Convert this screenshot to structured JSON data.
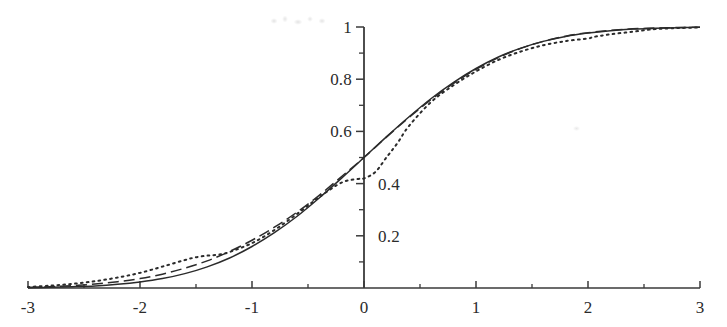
{
  "figure": {
    "background_color": "#ffffff",
    "ink_color": "#2b2b2b",
    "axis_color": "#3a3a3a",
    "artifacts": {
      "top_smudge_note": "faint illegible scan smudge",
      "right_speck_note": "faint scan speck"
    }
  },
  "chart_data": {
    "type": "line",
    "title": "",
    "subtitle": "",
    "xlabel": "",
    "ylabel": "",
    "xlim": [
      -3,
      3
    ],
    "ylim": [
      0,
      1
    ],
    "grid": false,
    "legend_position": "none",
    "x_ticks_major": [
      -3,
      -2,
      -1,
      0,
      1,
      2,
      3
    ],
    "x_tick_labels": [
      "-3",
      "-2",
      "-1",
      "0",
      "1",
      "2",
      "3"
    ],
    "x_ticks_minor": [
      -2.5,
      -1.5,
      -0.5,
      0.5,
      1.5,
      2.5
    ],
    "y_ticks_major": [
      0.2,
      0.4,
      0.6,
      0.8,
      1
    ],
    "y_tick_labels": [
      "0.2",
      "0.4",
      "0.6",
      "0.8",
      "1"
    ],
    "y_tick_label_side": [
      "right",
      "right",
      "left",
      "left",
      "left"
    ],
    "y_ticks_minor": [
      0.1,
      0.3,
      0.5,
      0.7,
      0.9
    ],
    "axis_position": {
      "y_axis_at_x": 0,
      "x_axis_at_y": 0
    },
    "series": [
      {
        "name": "solid-curve",
        "style": "solid",
        "color": "#2b2b2b",
        "x": [
          -3,
          -2.8,
          -2.6,
          -2.4,
          -2.2,
          -2,
          -1.8,
          -1.6,
          -1.4,
          -1.2,
          -1,
          -0.8,
          -0.6,
          -0.4,
          -0.2,
          0,
          0.2,
          0.4,
          0.6,
          0.8,
          1,
          1.2,
          1.4,
          1.6,
          1.8,
          2,
          2.2,
          2.4,
          2.6,
          2.8,
          3
        ],
        "values": [
          0.001,
          0.003,
          0.005,
          0.008,
          0.014,
          0.023,
          0.036,
          0.055,
          0.081,
          0.115,
          0.159,
          0.212,
          0.274,
          0.345,
          0.421,
          0.5,
          0.579,
          0.655,
          0.726,
          0.788,
          0.841,
          0.885,
          0.919,
          0.945,
          0.964,
          0.977,
          0.986,
          0.992,
          0.995,
          0.997,
          0.999
        ]
      },
      {
        "name": "dashed-curve",
        "style": "dashed",
        "color": "#2b2b2b",
        "x": [
          -3,
          -2.8,
          -2.6,
          -2.4,
          -2.2,
          -2,
          -1.8,
          -1.6,
          -1.4,
          -1.2,
          -1,
          -0.8,
          -0.6,
          -0.4,
          -0.2,
          0,
          0.2,
          0.4,
          0.6,
          0.8,
          1,
          1.2,
          1.4,
          1.6,
          1.8,
          2,
          2.2,
          2.4,
          2.6,
          2.8,
          3
        ],
        "values": [
          0.002,
          0.005,
          0.009,
          0.015,
          0.024,
          0.036,
          0.053,
          0.076,
          0.104,
          0.14,
          0.183,
          0.233,
          0.29,
          0.355,
          0.427,
          0.5,
          0.578,
          0.653,
          0.722,
          0.784,
          0.838,
          0.883,
          0.918,
          0.945,
          0.965,
          0.978,
          0.987,
          0.993,
          0.996,
          0.998,
          0.999
        ]
      },
      {
        "name": "dotted-curve",
        "style": "dotted",
        "color": "#2b2b2b",
        "x": [
          -3,
          -2.8,
          -2.6,
          -2.4,
          -2.2,
          -2,
          -1.8,
          -1.6,
          -1.5,
          -1.4,
          -1.3,
          -1.2,
          -1,
          -0.8,
          -0.6,
          -0.4,
          -0.2,
          -0.05,
          0,
          0.1,
          0.2,
          0.3,
          0.4,
          0.6,
          0.8,
          1,
          1.2,
          1.4,
          1.6,
          1.8,
          2,
          2.05,
          2.2,
          2.4,
          2.6,
          2.8,
          3
        ],
        "values": [
          0.004,
          0.009,
          0.016,
          0.026,
          0.04,
          0.058,
          0.082,
          0.107,
          0.118,
          0.124,
          0.128,
          0.138,
          0.172,
          0.222,
          0.283,
          0.348,
          0.404,
          0.418,
          0.42,
          0.444,
          0.5,
          0.556,
          0.62,
          0.713,
          0.777,
          0.83,
          0.874,
          0.906,
          0.93,
          0.946,
          0.956,
          0.962,
          0.972,
          0.982,
          0.992,
          0.996,
          0.998
        ]
      }
    ]
  }
}
